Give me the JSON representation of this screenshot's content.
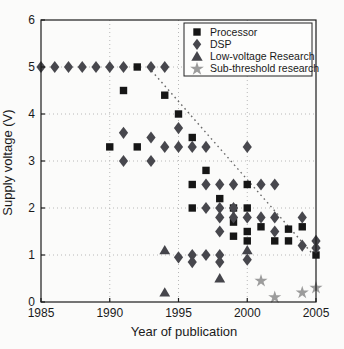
{
  "figure": {
    "background": "#fbfbfa",
    "width": 344,
    "height": 349
  },
  "chart_data": {
    "type": "scatter",
    "title": "",
    "xlabel": "Year of publication",
    "ylabel": "Supply voltage (V)",
    "xlim": [
      1985,
      2005
    ],
    "ylim": [
      0,
      6
    ],
    "xticks": [
      1985,
      1990,
      1995,
      2000,
      2005
    ],
    "yticks": [
      0,
      1,
      2,
      3,
      4,
      5,
      6
    ],
    "grid": "dotted",
    "grid_color": "#b8b8b8",
    "axis_color": "#1c1c1c",
    "legend_position": "top-right",
    "series": [
      {
        "name": "Processor",
        "marker": "square",
        "color": "#161616",
        "points": [
          [
            1992,
            5.0
          ],
          [
            1991,
            4.5
          ],
          [
            1994,
            4.4
          ],
          [
            1995,
            4.0
          ],
          [
            1996,
            3.5
          ],
          [
            1990,
            3.3
          ],
          [
            1992,
            3.3
          ],
          [
            1997,
            2.8
          ],
          [
            1996,
            2.5
          ],
          [
            2000,
            2.5
          ],
          [
            1998,
            2.2
          ],
          [
            1996,
            2.0
          ],
          [
            1999,
            2.0
          ],
          [
            2000,
            2.0
          ],
          [
            1999,
            1.7
          ],
          [
            1999,
            1.4
          ],
          [
            2000,
            1.5
          ],
          [
            2000,
            1.3
          ],
          [
            2001,
            1.6
          ],
          [
            2002,
            1.3
          ],
          [
            2003,
            1.55
          ],
          [
            2003,
            1.3
          ],
          [
            2004,
            1.6
          ],
          [
            2005,
            1.0
          ]
        ]
      },
      {
        "name": "DSP",
        "marker": "diamond",
        "color": "#47474d",
        "points": [
          [
            1985,
            5.0
          ],
          [
            1986,
            5.0
          ],
          [
            1987,
            5.0
          ],
          [
            1988,
            5.0
          ],
          [
            1989,
            5.0
          ],
          [
            1990,
            5.0
          ],
          [
            1991,
            5.0
          ],
          [
            1993,
            5.0
          ],
          [
            1994,
            5.0
          ],
          [
            1995,
            3.7
          ],
          [
            1991,
            3.6
          ],
          [
            1993,
            3.5
          ],
          [
            1994,
            3.3
          ],
          [
            1995,
            3.3
          ],
          [
            1996,
            3.3
          ],
          [
            1997,
            3.3
          ],
          [
            2000,
            3.3
          ],
          [
            1991,
            3.0
          ],
          [
            1993,
            3.0
          ],
          [
            1997,
            2.5
          ],
          [
            1998,
            2.5
          ],
          [
            1999,
            2.5
          ],
          [
            2001,
            2.5
          ],
          [
            2002,
            2.5
          ],
          [
            1997,
            2.0
          ],
          [
            1998,
            2.0
          ],
          [
            1999,
            2.0
          ],
          [
            1998,
            1.8
          ],
          [
            1999,
            1.8
          ],
          [
            2000,
            1.8
          ],
          [
            2001,
            1.8
          ],
          [
            2002,
            1.8
          ],
          [
            2004,
            1.8
          ],
          [
            1998,
            1.5
          ],
          [
            2002,
            1.5
          ],
          [
            1995,
            0.95
          ],
          [
            1996,
            1.0
          ],
          [
            1996,
            0.85
          ],
          [
            1997,
            1.0
          ],
          [
            1998,
            1.0
          ],
          [
            1998,
            0.85
          ],
          [
            2000,
            0.9
          ],
          [
            2004,
            1.2
          ],
          [
            2005,
            1.3
          ],
          [
            2005,
            1.15
          ]
        ]
      },
      {
        "name": "Low-voltage Research",
        "marker": "triangle",
        "color": "#45454b",
        "points": [
          [
            1994,
            1.1
          ],
          [
            1994,
            0.2
          ],
          [
            1998,
            0.5
          ],
          [
            2000,
            1.1
          ]
        ]
      },
      {
        "name": "Sub-threshold research",
        "marker": "star",
        "color": "#9c9c9c",
        "points": [
          [
            2001,
            0.45
          ],
          [
            2002,
            0.1
          ],
          [
            2004,
            0.2
          ],
          [
            2005,
            0.3
          ]
        ]
      }
    ],
    "trend_line": {
      "style": "dotted",
      "color": "#6a6a6a",
      "from": [
        1992.8,
        5.0
      ],
      "to": [
        2005,
        0.94
      ]
    }
  }
}
